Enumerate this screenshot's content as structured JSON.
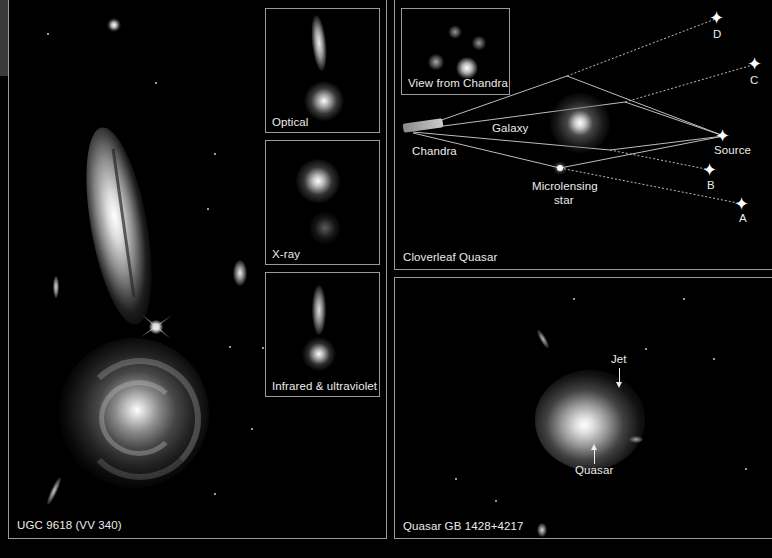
{
  "figure": {
    "panels": {
      "left": {
        "label": "UGC 9618 (VV 340)",
        "insets": [
          {
            "label": "Optical"
          },
          {
            "label": "X-ray"
          },
          {
            "label": "Infrared & ultraviolet"
          }
        ]
      },
      "top_right": {
        "label": "Cloverleaf Quasar",
        "inset_label": "View from Chandra",
        "diagram": {
          "observer": "Chandra",
          "lens": "Galaxy",
          "microlens": "Microlensing",
          "microlens_line2": "star",
          "source": "Source",
          "images": [
            "A",
            "B",
            "C",
            "D"
          ]
        }
      },
      "bottom_right": {
        "label": "Quasar GB 1428+4217",
        "annotations": {
          "jet": "Jet",
          "quasar": "Quasar"
        }
      }
    },
    "colors": {
      "border": "#9a9a9a",
      "background": "#000000",
      "text": "#ececec"
    }
  }
}
